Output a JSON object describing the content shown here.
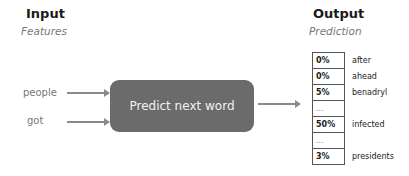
{
  "input": {
    "title": "Input",
    "subtitle": "Features",
    "words": [
      "people",
      "got"
    ]
  },
  "model": {
    "label": "Predict next word"
  },
  "output": {
    "title": "Output",
    "subtitle": "Prediction",
    "rows": [
      {
        "prob": "0%",
        "word": "after"
      },
      {
        "prob": "0%",
        "word": "ahead"
      },
      {
        "prob": "5%",
        "word": "benadryl"
      },
      {
        "prob": "...",
        "word": ""
      },
      {
        "prob": "50%",
        "word": "infected"
      },
      {
        "prob": "...",
        "word": ""
      },
      {
        "prob": "3%",
        "word": "presidents"
      }
    ]
  },
  "colors": {
    "box": "#6b6b6b",
    "arrow": "#8a8a8a"
  }
}
